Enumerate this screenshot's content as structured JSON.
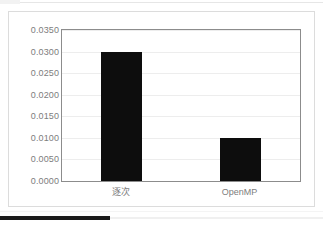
{
  "chart_data": {
    "type": "bar",
    "title": "",
    "subtitle": "",
    "xlabel": "",
    "ylabel": "",
    "categories": [
      "逐次",
      "OpenMP"
    ],
    "values": [
      0.03,
      0.01
    ],
    "series": [
      {
        "name": "",
        "values": [
          0.03,
          0.01
        ]
      }
    ],
    "ylim": [
      0.0,
      0.035
    ],
    "ytick_values": [
      0.0,
      0.005,
      0.01,
      0.015,
      0.02,
      0.025,
      0.03,
      0.035
    ],
    "ytick_labels": [
      "0.0000",
      "0.0050",
      "0.0100",
      "0.0150",
      "0.0200",
      "0.0250",
      "0.0300",
      "0.0350"
    ],
    "grid": true,
    "grid_axis": "y",
    "legend": false,
    "legend_position": "none",
    "bar_color": "#0d0d0d",
    "gridline_color": "#ededed",
    "axis_color": "#8c8c8c",
    "tick_label_color": "#7d7d7d",
    "plot_background": "#ffffff",
    "annotations": []
  },
  "card": {
    "border_color": "#dcdcdc",
    "background": "#ffffff"
  },
  "bottom_indicator": {
    "color": "#1b1b1b",
    "track_color": "#f0f0f0"
  }
}
